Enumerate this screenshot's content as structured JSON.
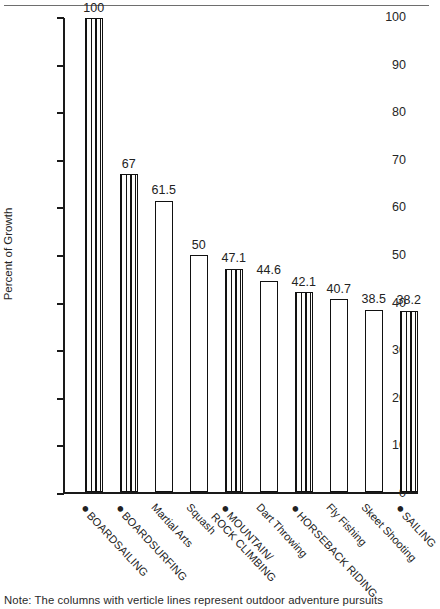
{
  "chart_data": {
    "type": "bar",
    "title": "",
    "xlabel": "",
    "ylabel": "Percent of Growth",
    "ylim": [
      0,
      100
    ],
    "yticks": [
      0,
      10,
      20,
      30,
      40,
      50,
      60,
      70,
      80,
      90,
      100
    ],
    "grid": false,
    "legend": "",
    "categories": [
      "BOARDSAILING",
      "BOARDSURFING",
      "Martial Arts",
      "Squash",
      "MOUNTAIN/ ROCK CLIMBING",
      "Dart Throwing",
      "HORSEBACK RIDING",
      "Fly Fishing",
      "Skeet Shooting",
      "SAILING"
    ],
    "values": [
      100,
      67,
      61.5,
      50,
      47.1,
      44.6,
      42.1,
      40.7,
      38.5,
      38.2
    ],
    "value_labels": [
      "100",
      "67",
      "61.5",
      "50",
      "47.1",
      "44.6",
      "42.1",
      "40.7",
      "38.5",
      "38.2"
    ],
    "patterns": [
      "lines",
      "lines",
      "check",
      "check",
      "lines",
      "check",
      "lines",
      "check",
      "check",
      "lines"
    ],
    "bulleted": [
      true,
      true,
      false,
      false,
      true,
      false,
      true,
      false,
      false,
      true
    ],
    "annotation": "Note: The columns with verticle lines represent outdoor adventure pursuits"
  },
  "axis": {
    "y_title": "Percent of Growth",
    "ticks": [
      "100",
      "90",
      "80",
      "70",
      "60",
      "50",
      "40",
      "30",
      "20",
      "10",
      "0"
    ]
  },
  "xlabels": [
    {
      "line1": "BOARDSAILING",
      "line2": "",
      "bullet": "●"
    },
    {
      "line1": "BOARDSURFING",
      "line2": "",
      "bullet": "●"
    },
    {
      "line1": "Martial Arts",
      "line2": "",
      "bullet": ""
    },
    {
      "line1": "Squash",
      "line2": "",
      "bullet": ""
    },
    {
      "line1": "MOUNTAIN/",
      "line2": "ROCK CLIMBING",
      "bullet": "●"
    },
    {
      "line1": "Dart Throwing",
      "line2": "",
      "bullet": ""
    },
    {
      "line1": "HORSEBACK RIDING",
      "line2": "",
      "bullet": "●"
    },
    {
      "line1": "Fly Fishing",
      "line2": "",
      "bullet": ""
    },
    {
      "line1": "Skeet Shooting",
      "line2": "",
      "bullet": ""
    },
    {
      "line1": "SAILING",
      "line2": "",
      "bullet": "●"
    }
  ],
  "note": {
    "text": "Note: The columns with verticle lines represent outdoor adventure pursuits"
  }
}
